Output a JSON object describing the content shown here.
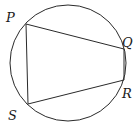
{
  "diagram": {
    "type": "cyclic-quadrilateral",
    "circle": {
      "cx": 68,
      "cy": 63,
      "r": 58
    },
    "vertices": [
      {
        "name": "P",
        "x": 26,
        "y": 24,
        "label_x": 6,
        "label_y": 22
      },
      {
        "name": "Q",
        "x": 124,
        "y": 49,
        "label_x": 122,
        "label_y": 47
      },
      {
        "name": "R",
        "x": 124,
        "y": 80,
        "label_x": 122,
        "label_y": 98
      },
      {
        "name": "S",
        "x": 28,
        "y": 104,
        "label_x": 8,
        "label_y": 120
      }
    ],
    "labels": {
      "P": "P",
      "Q": "Q",
      "R": "R",
      "S": "S"
    },
    "stroke_color": "#2a2a2a"
  }
}
